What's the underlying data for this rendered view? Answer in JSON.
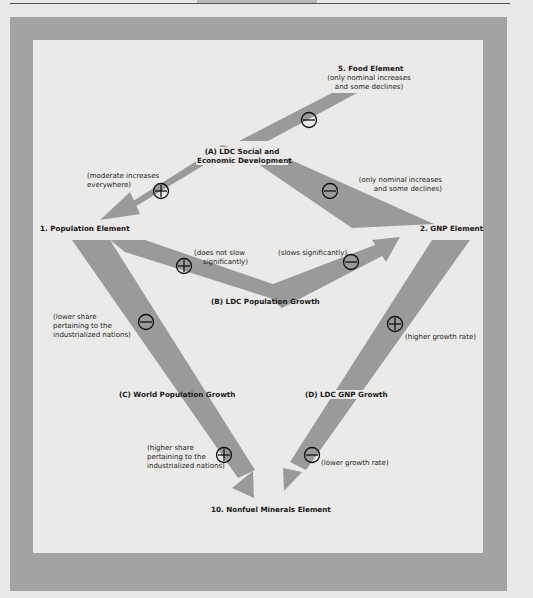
{
  "page": {
    "frame_color": "#a3a3a3",
    "panel_color": "#ebeae8",
    "arrow_color": "#9a9a9a"
  },
  "nodes": {
    "food": "5. Food Element",
    "ldc_social": [
      "(A) LDC Social and",
      "Economic Development"
    ],
    "population": "1. Population Element",
    "gnp": "2. GNP Element",
    "ldc_pop_growth": "(B) LDC Population Growth",
    "world_pop_growth": "(C) World Population Growth",
    "ldc_gnp_growth": "(D) LDC GNP Growth",
    "nonfuel": "10. Nonfuel Minerals Element"
  },
  "annotations": {
    "food_note": [
      "(only nominal increases",
      "and some declines)"
    ],
    "gnp_note": [
      "(only nominal increases",
      "and some declines)"
    ],
    "pop_note": [
      "(moderate increases",
      "everywhere)"
    ],
    "does_not_slow": [
      "(does not slow",
      "significantly)"
    ],
    "slows": "(slows significantly)",
    "lower_share": [
      "(lower share",
      "pertaining to the",
      "industrialized nations)"
    ],
    "higher_share": [
      "(higher share",
      "pertaining to the",
      "industrialized nations)"
    ],
    "higher_growth": "(higher growth rate)",
    "lower_growth": "(lower growth rate)"
  },
  "signs": {
    "food": "minus",
    "population": "plus",
    "gnp": "minus",
    "pop_to_ldcpop": "plus",
    "ldcpop_to_gnp": "minus",
    "pop_to_world": "minus",
    "world_to_nonfuel": "plus",
    "gnp_to_ldcgnp": "plus",
    "ldcgnp_to_nonfuel": "minus"
  }
}
